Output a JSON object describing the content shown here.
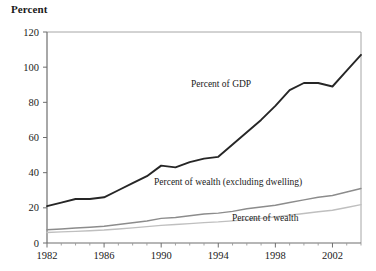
{
  "chart_data": {
    "type": "line",
    "title": "",
    "ylabel": "Percent",
    "xlabel": "",
    "ylim": [
      0,
      120
    ],
    "xlim": [
      1982,
      2004
    ],
    "ytick_labels": [
      "0",
      "20",
      "40",
      "60",
      "80",
      "100",
      "120"
    ],
    "yticks": [
      0,
      20,
      40,
      60,
      80,
      100,
      120
    ],
    "xtick_labels": [
      "1982",
      "1986",
      "1990",
      "1994",
      "1998",
      "2002"
    ],
    "xticks": [
      1982,
      1986,
      1990,
      1994,
      1998,
      2002
    ],
    "minor_xticks": [
      1983,
      1984,
      1985,
      1987,
      1988,
      1989,
      1991,
      1992,
      1993,
      1995,
      1996,
      1997,
      1999,
      2000,
      2001,
      2003,
      2004
    ],
    "grid": false,
    "legend_position": "inline-annotations",
    "x": [
      1982,
      1983,
      1984,
      1985,
      1986,
      1987,
      1988,
      1989,
      1990,
      1991,
      1992,
      1993,
      1994,
      1995,
      1996,
      1997,
      1998,
      1999,
      2000,
      2001,
      2002,
      2003,
      2004
    ],
    "series": [
      {
        "name": "Percent of GDP",
        "color": "#262626",
        "width": 1.9,
        "values": [
          21,
          23,
          25,
          25,
          26,
          30,
          34,
          38,
          44,
          43,
          46,
          48,
          49,
          56,
          63,
          70,
          78,
          87,
          91,
          91,
          89,
          98,
          107
        ]
      },
      {
        "name": "Percent of wealth (excluding dwelling)",
        "color": "#8c8c8c",
        "width": 1.4,
        "values": [
          7.5,
          8.0,
          8.5,
          9.0,
          9.5,
          10.5,
          11.5,
          12.5,
          14.0,
          14.5,
          15.5,
          16.5,
          17.0,
          18.0,
          19.5,
          20.5,
          21.5,
          23.0,
          24.5,
          26.0,
          27.0,
          29.0,
          31.0
        ]
      },
      {
        "name": "Percent of wealth",
        "color": "#bfbfbf",
        "width": 1.4,
        "values": [
          6.0,
          6.3,
          6.6,
          7.0,
          7.4,
          8.0,
          8.6,
          9.3,
          10.0,
          10.5,
          11.0,
          11.6,
          12.0,
          12.6,
          13.3,
          14.0,
          14.8,
          15.8,
          16.8,
          17.8,
          18.6,
          20.2,
          21.8
        ]
      }
    ],
    "annotations": [
      {
        "text": "Percent of GDP",
        "x_px": 191,
        "y_px": 87
      },
      {
        "text": "Percent of wealth (excluding dwelling)",
        "x_px": 154,
        "y_px": 185
      },
      {
        "text": "Percent of wealth",
        "x_px": 232,
        "y_px": 221
      }
    ],
    "colors": {
      "axis": "#6e6e6e",
      "frame": "#9a9a9a",
      "text": "#1a1a1a",
      "background": "#ffffff"
    }
  }
}
